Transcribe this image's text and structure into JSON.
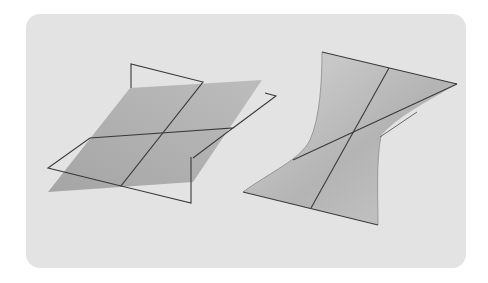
{
  "figure": {
    "colors": {
      "background": "#ffffff",
      "panel": "#e3e3e3",
      "plane_fill": "#a9a9a9",
      "surface_fill_light": "#d2d2d2",
      "surface_fill_dark": "#a0a0a0",
      "line": "#3a3a3a"
    },
    "left_figure": {
      "name": "intersecting-planes",
      "labels": []
    },
    "right_figure": {
      "name": "ruled-saddle-surface",
      "labels": []
    }
  }
}
